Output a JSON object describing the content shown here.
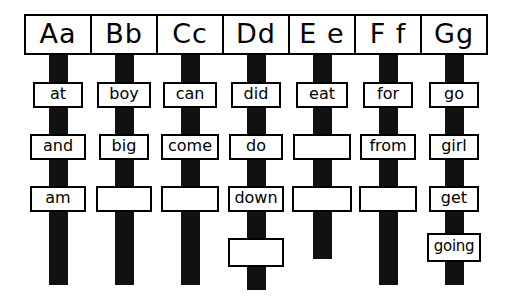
{
  "chart": {
    "ink_color": "#111111",
    "paper_color": "#ffffff",
    "columns": [
      {
        "letter": "Aa",
        "header_label": "Aa",
        "bar_bottom": 285,
        "boxes": [
          {
            "label": "at",
            "filled": true,
            "width": 50,
            "row": 1
          },
          {
            "label": "and",
            "filled": true,
            "width": 56,
            "row": 2
          },
          {
            "label": "am",
            "filled": true,
            "width": 56,
            "row": 3
          }
        ]
      },
      {
        "letter": "Bb",
        "header_label": "Bb",
        "bar_bottom": 285,
        "boxes": [
          {
            "label": "boy",
            "filled": true,
            "width": 54,
            "row": 1
          },
          {
            "label": "big",
            "filled": true,
            "width": 50,
            "row": 2
          },
          {
            "label": "",
            "filled": false,
            "width": 56,
            "row": 3
          }
        ]
      },
      {
        "letter": "Cc",
        "header_label": "Cc",
        "bar_bottom": 285,
        "boxes": [
          {
            "label": "can",
            "filled": true,
            "width": 54,
            "row": 1
          },
          {
            "label": "come",
            "filled": true,
            "width": 58,
            "row": 2
          },
          {
            "label": "",
            "filled": false,
            "width": 58,
            "row": 3
          }
        ]
      },
      {
        "letter": "Dd",
        "header_label": "Dd",
        "bar_bottom": 290,
        "boxes": [
          {
            "label": "did",
            "filled": true,
            "width": 50,
            "row": 1
          },
          {
            "label": "do",
            "filled": true,
            "width": 54,
            "row": 2
          },
          {
            "label": "down",
            "filled": true,
            "width": 56,
            "row": 3
          },
          {
            "label": "",
            "filled": false,
            "width": 56,
            "row": 4
          }
        ]
      },
      {
        "letter": "E e",
        "header_label": "E e",
        "bar_bottom": 259,
        "boxes": [
          {
            "label": "eat",
            "filled": true,
            "width": 52,
            "row": 1
          },
          {
            "label": "",
            "filled": false,
            "width": 58,
            "row": 2
          },
          {
            "label": "",
            "filled": false,
            "width": 60,
            "row": 3
          }
        ]
      },
      {
        "letter": "Ff",
        "header_label": "F f",
        "bar_bottom": 285,
        "boxes": [
          {
            "label": "for",
            "filled": true,
            "width": 50,
            "row": 1
          },
          {
            "label": "from",
            "filled": true,
            "width": 56,
            "row": 2
          },
          {
            "label": "",
            "filled": false,
            "width": 58,
            "row": 3
          }
        ]
      },
      {
        "letter": "Gg",
        "header_label": "Gg",
        "bar_bottom": 285,
        "boxes": [
          {
            "label": "go",
            "filled": true,
            "width": 50,
            "row": 1
          },
          {
            "label": "girl",
            "filled": true,
            "width": 50,
            "row": 2
          },
          {
            "label": "get",
            "filled": true,
            "width": 50,
            "row": 3
          },
          {
            "label": "going",
            "filled": true,
            "width": 54,
            "row": 4
          }
        ]
      }
    ],
    "row_tops": {
      "1": 82,
      "2": 134,
      "3": 186,
      "4": 234
    },
    "row4_tops": {
      "Dd": 238,
      "Gg": 233
    }
  }
}
